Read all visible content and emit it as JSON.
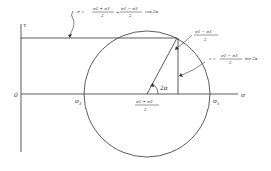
{
  "diagram": {
    "axes": {
      "tau_label": "τ",
      "sigma_label": "σ",
      "origin_label": "0"
    },
    "points": {
      "sigma3": "σ3",
      "sigma1": "σ1",
      "sigma3_base": "σ",
      "sigma3_sub": "3",
      "sigma1_base": "σ",
      "sigma1_sub": "1"
    },
    "center_label": {
      "numerator": "σ1 + σ3",
      "denominator": "2"
    },
    "angle_label": "2α",
    "radius_label": {
      "numerator": "σ1 − σ3",
      "denominator": "2"
    },
    "sigma_equation": {
      "lhs": "σ =",
      "term1_num": "σ1 + σ3",
      "term1_den": "2",
      "plus": "+",
      "term2_num": "σ1 − σ3",
      "term2_den": "2",
      "trig": "cos 2α"
    },
    "tau_equation": {
      "lhs": "τ =",
      "num": "σ1 − σ3",
      "den": "2",
      "trig": "sin 2α"
    },
    "colors": {
      "line": "#333333",
      "background": "#ffffff"
    }
  }
}
